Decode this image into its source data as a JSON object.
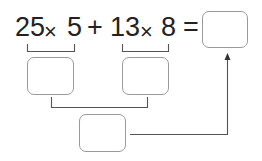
{
  "expression": {
    "tokens": [
      "25",
      "×",
      "5",
      "+",
      "13",
      "×",
      "8",
      "="
    ],
    "result_box_value": ""
  },
  "intermediate": {
    "box_a_value": "",
    "box_b_value": "",
    "box_c_value": ""
  },
  "colors": {
    "text": "#222222",
    "box_border": "#9a9a9a",
    "line": "#555555"
  }
}
